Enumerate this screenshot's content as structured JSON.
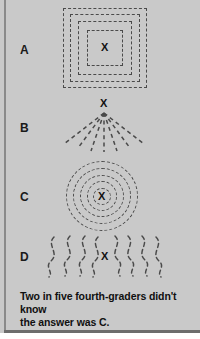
{
  "figure": {
    "background_color": "#c9c9c9",
    "ink_color": "#4a4a4a",
    "text_color": "#111111",
    "width": 200,
    "height": 339
  },
  "options": [
    {
      "label": "A",
      "marker": "X",
      "pattern_name": "nested-dashed-squares",
      "description": "Four concentric dashed squares centered on X"
    },
    {
      "label": "B",
      "marker": "X",
      "pattern_name": "dashed-rays-fan",
      "description": "Seven dashed straight rays fanning downward from X"
    },
    {
      "label": "C",
      "marker": "X",
      "pattern_name": "concentric-dashed-circles",
      "description": "Five concentric dashed circles centered on X"
    },
    {
      "label": "D",
      "marker": "X",
      "pattern_name": "wavy-dashed-vertical-lines",
      "description": "Eight wavy dashed vertical lines flanking X"
    }
  ],
  "caption": {
    "text": "Two in five fourth-graders didn't know the answer was C.",
    "line1": "Two in five fourth-graders didn't know",
    "line2": "the answer was C."
  }
}
